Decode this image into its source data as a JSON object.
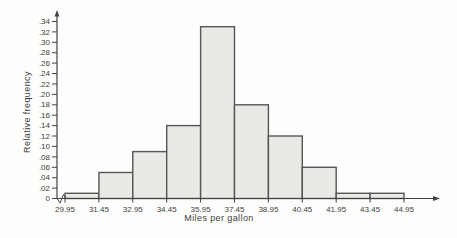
{
  "chart_data": {
    "type": "bar",
    "subtype": "histogram",
    "title": "",
    "xlabel": "Miles per gallon",
    "ylabel": "Relative frequency",
    "bin_edges": [
      29.95,
      31.45,
      32.95,
      34.45,
      35.95,
      37.45,
      38.95,
      40.45,
      41.95,
      43.45,
      44.95
    ],
    "x_tick_labels": [
      "29.95",
      "31.45",
      "32.95",
      "34.45",
      "35.95",
      "37.45",
      "38.95",
      "40.45",
      "41.95",
      "43.45",
      "44.95"
    ],
    "values": [
      0.01,
      0.05,
      0.09,
      0.14,
      0.33,
      0.18,
      0.12,
      0.06,
      0.01,
      0.01
    ],
    "y_tick_labels": [
      "0",
      ".02",
      ".04",
      ".06",
      ".08",
      ".10",
      ".12",
      ".14",
      ".16",
      ".18",
      ".20",
      ".22",
      ".24",
      ".26",
      ".28",
      ".30",
      ".32",
      ".34"
    ],
    "y_tick_values": [
      0,
      0.02,
      0.04,
      0.06,
      0.08,
      0.1,
      0.12,
      0.14,
      0.16,
      0.18,
      0.2,
      0.22,
      0.24,
      0.26,
      0.28,
      0.3,
      0.32,
      0.34
    ],
    "ylim": [
      0,
      0.34
    ],
    "grid": false,
    "legend": false,
    "axis_break_on_x_origin": true,
    "axis_arrows": [
      "x-right",
      "y-top"
    ],
    "colors": {
      "background": "#fdfdfb",
      "bar_fill": "#e9e9e6",
      "bar_stroke": "#565656",
      "axis": "#424242",
      "text": "#3e3e3e"
    }
  }
}
